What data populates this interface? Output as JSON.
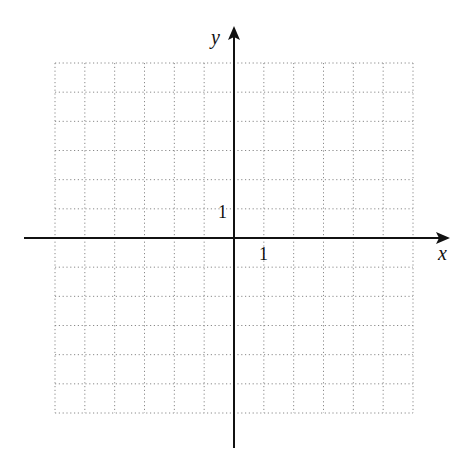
{
  "diagram": {
    "type": "coordinate-grid",
    "x_axis_label": "x",
    "y_axis_label": "y",
    "x_tick_label": "1",
    "y_tick_label": "1",
    "grid": {
      "columns": 12,
      "rows": 12,
      "left": 55,
      "top": 63,
      "right": 413,
      "bottom": 413,
      "line_style": "dotted",
      "line_color": "#8a8a8a"
    },
    "axes": {
      "origin_x": 234,
      "origin_y": 238,
      "x_start": 24,
      "x_end": 448,
      "y_start": 448,
      "y_end": 28,
      "color": "#111111"
    }
  }
}
